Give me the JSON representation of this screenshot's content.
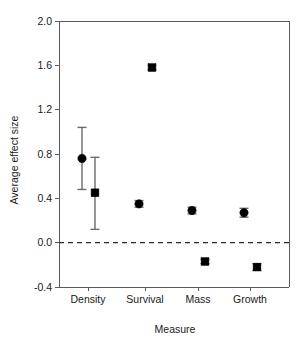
{
  "chart_data": {
    "type": "scatter",
    "title": "",
    "xlabel": "Measure",
    "ylabel": "Average effect size",
    "categories": [
      "Density",
      "Survival",
      "Mass",
      "Growth"
    ],
    "ylim": [
      -0.4,
      2.0
    ],
    "yticks": [
      "-0.4",
      "0.0",
      "0.4",
      "0.8",
      "1.2",
      "1.6",
      "2.0"
    ],
    "ytick_values": [
      -0.4,
      0.0,
      0.4,
      0.8,
      1.2,
      1.6,
      2.0
    ],
    "grid": false,
    "legend": "none",
    "reference_line": {
      "value": 0.0,
      "style": "dashed"
    },
    "series": [
      {
        "name": "circle",
        "marker": "circle",
        "values": [
          0.76,
          0.35,
          0.29,
          0.27
        ],
        "err_low": [
          0.48,
          0.32,
          0.26,
          0.23
        ],
        "err_high": [
          1.04,
          0.38,
          0.32,
          0.31
        ]
      },
      {
        "name": "square",
        "marker": "square",
        "values": [
          0.45,
          1.58,
          -0.17,
          -0.22
        ],
        "err_low": [
          0.12,
          1.56,
          -0.19,
          -0.25
        ],
        "err_high": [
          0.77,
          1.6,
          -0.15,
          -0.19
        ]
      }
    ],
    "category_x": [
      88,
      145,
      198,
      250
    ],
    "series_offsets": [
      -6,
      7
    ]
  }
}
